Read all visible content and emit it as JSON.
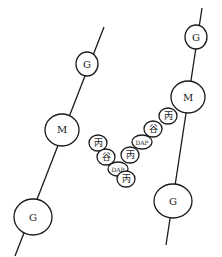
{
  "diagram": {
    "title": "",
    "colors": {
      "stroke": "#1a1a1a",
      "fill": "#ffffff"
    },
    "left_strand": {
      "nodes": [
        {
          "label": "G",
          "cx": 87,
          "cy": 64,
          "rx": 11,
          "ry": 12
        },
        {
          "label": "M",
          "cx": 62,
          "cy": 130,
          "rx": 17,
          "ry": 16
        },
        {
          "label": "G",
          "cx": 33,
          "cy": 217,
          "rx": 19,
          "ry": 18
        }
      ]
    },
    "right_strand": {
      "nodes": [
        {
          "label": "G",
          "cx": 196,
          "cy": 37,
          "rx": 16,
          "ry": 14
        },
        {
          "label": "M",
          "cx": 188,
          "cy": 97,
          "rx": 18,
          "ry": 16
        },
        {
          "label": "G",
          "cx": 173,
          "cy": 201,
          "rx": 19,
          "ry": 17
        }
      ]
    },
    "crossbridge": [
      {
        "label": "丙",
        "cx": 98,
        "cy": 143
      },
      {
        "label": "谷",
        "cx": 106,
        "cy": 157
      },
      {
        "label": "DAP",
        "cx": 117,
        "cy": 168
      },
      {
        "label": "丙",
        "cx": 123,
        "cy": 182
      },
      {
        "label": "丙",
        "cx": 129,
        "cy": 153
      },
      {
        "label": "DAP",
        "cx": 145,
        "cy": 140
      },
      {
        "label": "谷",
        "cx": 155,
        "cy": 128
      },
      {
        "label": "丙",
        "cx": 169,
        "cy": 115
      }
    ]
  }
}
